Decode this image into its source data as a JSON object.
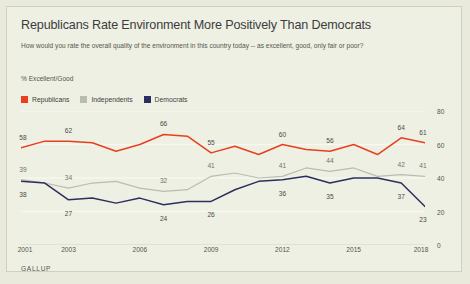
{
  "title": "Republicans Rate Environment More Positively Than Democrats",
  "subtitle": "How would you rate the overall quality of the environment in this country today -- as excellent, good, only fair or poor?",
  "unit_label": "% Excellent/Good",
  "source": "GALLUP",
  "colors": {
    "republicans": "#e8401e",
    "independents": "#b9bcb0",
    "democrats": "#2b2f5e",
    "background": "#eff0e4",
    "page": "#e9e9dc",
    "grid": "#f7f8ee",
    "text": "#55554e",
    "title_text": "#3c3c3c"
  },
  "legend": [
    {
      "label": "Republicans",
      "color_key": "republicans"
    },
    {
      "label": "Independents",
      "color_key": "independents"
    },
    {
      "label": "Democrats",
      "color_key": "democrats"
    }
  ],
  "chart_data": {
    "type": "line",
    "title": "Republicans Rate Environment More Positively Than Democrats",
    "subtitle": "How would you rate the overall quality of the environment in this country today -- as excellent, good, only fair or poor?",
    "ylabel": "% Excellent/Good",
    "xlabel": "",
    "ylim": [
      0,
      80
    ],
    "yticks": [
      0,
      20,
      40,
      60,
      80
    ],
    "xticks": [
      2001,
      2003,
      2006,
      2009,
      2012,
      2015,
      2018
    ],
    "grid": true,
    "legend_position": "top-left",
    "x": [
      2001,
      2002,
      2003,
      2004,
      2005,
      2006,
      2007,
      2008,
      2009,
      2010,
      2011,
      2012,
      2013,
      2014,
      2015,
      2016,
      2017,
      2018
    ],
    "series": [
      {
        "name": "Republicans",
        "color": "#e8401e",
        "values": [
          58,
          62,
          62,
          61,
          56,
          60,
          66,
          65,
          55,
          59,
          54,
          60,
          57,
          56,
          60,
          54,
          64,
          61
        ],
        "labels": [
          {
            "x": 2001,
            "value": 58
          },
          {
            "x": 2003,
            "value": 62
          },
          {
            "x": 2007,
            "value": 66
          },
          {
            "x": 2009,
            "value": 55
          },
          {
            "x": 2012,
            "value": 60
          },
          {
            "x": 2014,
            "value": 56
          },
          {
            "x": 2017,
            "value": 64
          },
          {
            "x": 2018,
            "value": 61
          }
        ]
      },
      {
        "name": "Independents",
        "color": "#b9bcb0",
        "values": [
          39,
          37,
          34,
          37,
          38,
          34,
          32,
          33,
          41,
          43,
          40,
          41,
          46,
          44,
          46,
          41,
          42,
          41
        ],
        "labels": [
          {
            "x": 2001,
            "value": 39
          },
          {
            "x": 2003,
            "value": 34
          },
          {
            "x": 2007,
            "value": 32
          },
          {
            "x": 2009,
            "value": 41
          },
          {
            "x": 2012,
            "value": 41
          },
          {
            "x": 2014,
            "value": 44
          },
          {
            "x": 2017,
            "value": 42
          },
          {
            "x": 2018,
            "value": 41
          }
        ]
      },
      {
        "name": "Democrats",
        "color": "#2b2f5e",
        "values": [
          38,
          37,
          27,
          28,
          25,
          28,
          24,
          26,
          26,
          33,
          38,
          39,
          41,
          37,
          40,
          40,
          37,
          23
        ],
        "labels": [
          {
            "x": 2001,
            "value": 38
          },
          {
            "x": 2003,
            "value": 27
          },
          {
            "x": 2007,
            "value": 24
          },
          {
            "x": 2009,
            "value": 26
          },
          {
            "x": 2012,
            "value": 36
          },
          {
            "x": 2014,
            "value": 35
          },
          {
            "x": 2017,
            "value": 37
          },
          {
            "x": 2018,
            "value": 23
          }
        ]
      }
    ]
  }
}
